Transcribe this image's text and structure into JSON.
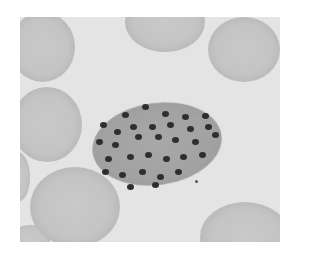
{
  "image": {
    "description": "Grayscale blood smear micrograph showing an infected cell with many dark merozoite nuclei surrounded by red blood cells",
    "colors": {
      "background": "#e4e4e4",
      "rbc": "#c4c4c4",
      "cell": "#a2a2a2",
      "nuclei": "#2e2e2e"
    }
  },
  "rbcs": [
    {
      "x": -10,
      "y": -5,
      "w": 65,
      "h": 70
    },
    {
      "x": 105,
      "y": -25,
      "w": 80,
      "h": 60
    },
    {
      "x": 188,
      "y": 0,
      "w": 72,
      "h": 65
    },
    {
      "x": -8,
      "y": 70,
      "w": 70,
      "h": 75
    },
    {
      "x": 10,
      "y": 150,
      "w": 90,
      "h": 80
    },
    {
      "x": -15,
      "y": 135,
      "w": 25,
      "h": 50
    },
    {
      "x": 180,
      "y": 185,
      "w": 90,
      "h": 70
    },
    {
      "x": -10,
      "y": 208,
      "w": 40,
      "h": 30
    }
  ],
  "nuclei": [
    [
      125,
      90
    ],
    [
      105,
      98
    ],
    [
      145,
      97
    ],
    [
      165,
      100
    ],
    [
      185,
      99
    ],
    [
      83,
      108
    ],
    [
      97,
      115
    ],
    [
      113,
      110
    ],
    [
      132,
      110
    ],
    [
      150,
      108
    ],
    [
      170,
      112
    ],
    [
      188,
      110
    ],
    [
      79,
      125
    ],
    [
      95,
      128
    ],
    [
      118,
      120
    ],
    [
      138,
      120
    ],
    [
      155,
      123
    ],
    [
      175,
      125
    ],
    [
      195,
      118
    ],
    [
      88,
      142
    ],
    [
      110,
      140
    ],
    [
      128,
      138
    ],
    [
      146,
      142
    ],
    [
      163,
      140
    ],
    [
      182,
      138
    ],
    [
      85,
      155
    ],
    [
      102,
      158
    ],
    [
      122,
      155
    ],
    [
      140,
      160
    ],
    [
      158,
      155
    ],
    [
      110,
      170
    ],
    [
      135,
      168
    ]
  ]
}
